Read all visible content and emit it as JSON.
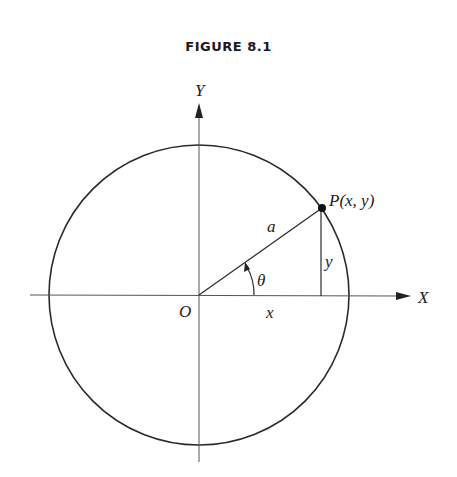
{
  "figure": {
    "title": "FIGURE 8.1"
  },
  "labels": {
    "y_axis": "Y",
    "x_axis": "X",
    "origin": "O",
    "point": "P(x, y)",
    "radius": "a",
    "angle": "θ",
    "x_leg": "x",
    "y_leg": "y"
  },
  "colors": {
    "stroke": "#2a2a2a",
    "axis": "#555555",
    "background": "#ffffff"
  }
}
